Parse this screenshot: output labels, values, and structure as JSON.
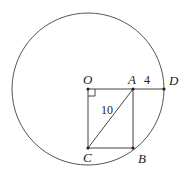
{
  "diagram": {
    "circle": {
      "cx": 88,
      "cy": 89,
      "r": 76,
      "stroke": "#555555"
    },
    "points": {
      "O": {
        "label": "O",
        "x": 88,
        "y": 89
      },
      "A": {
        "label": "A",
        "x": 133,
        "y": 89
      },
      "D": {
        "label": "D",
        "x": 164,
        "y": 89
      },
      "B": {
        "label": "B",
        "x": 133,
        "y": 148
      },
      "C": {
        "label": "C",
        "x": 88,
        "y": 148
      }
    },
    "segments": [
      "OD",
      "OC",
      "AB",
      "CB",
      "AC"
    ],
    "measurements": {
      "AC": "10",
      "AD": "4"
    },
    "right_angle_at": "O"
  }
}
